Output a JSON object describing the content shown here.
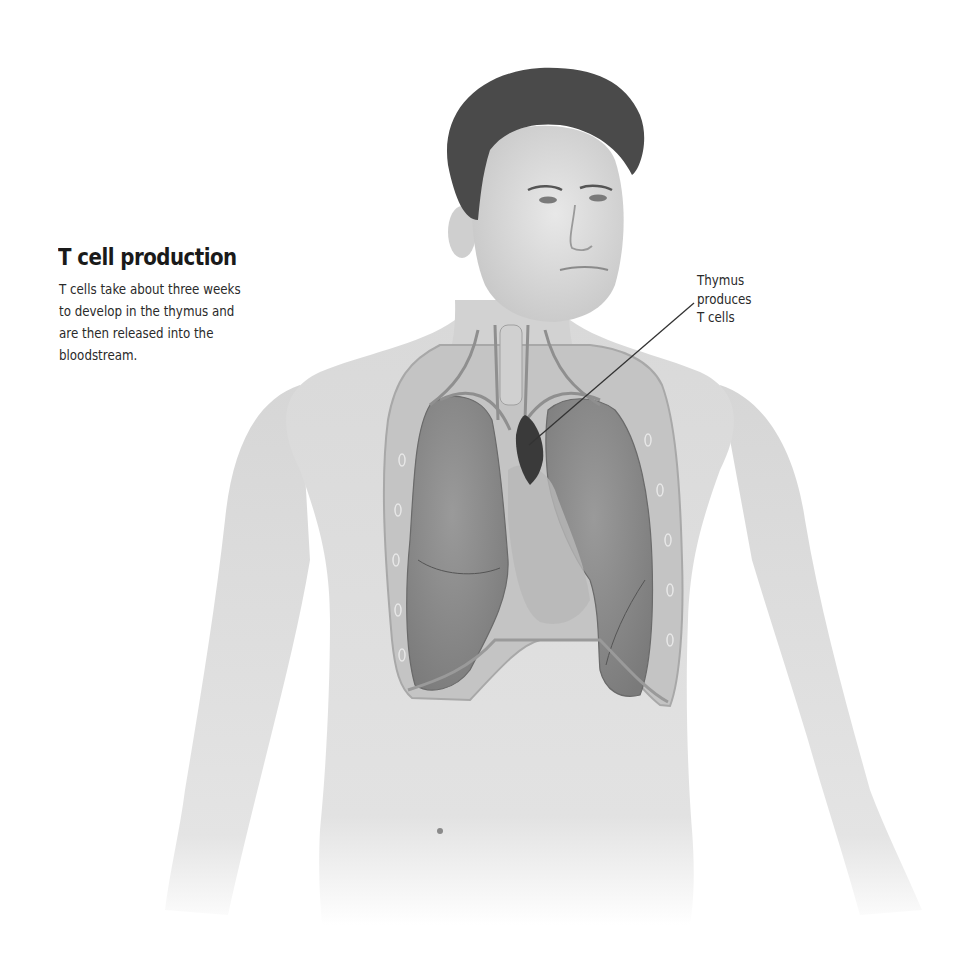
{
  "heading": {
    "title": "T cell production",
    "description_lines": [
      "T cells take about three weeks",
      "to develop in the thymus and",
      "are then released into the",
      "bloodstream."
    ]
  },
  "callouts": [
    {
      "target": "thymus",
      "lines": [
        "Thymus",
        "produces",
        "T cells"
      ]
    }
  ],
  "illustration": {
    "subject": "male-torso-anatomy",
    "visible_structures": [
      "head",
      "neck-vessels",
      "trachea",
      "thymus",
      "left-lung",
      "right-lung",
      "heart-outline",
      "diaphragm",
      "ribs",
      "navel",
      "arms"
    ],
    "colors": {
      "background": "#ffffff",
      "skin": "#dcdcdc",
      "hair": "#4a4a4a",
      "lung": "#8c8c8c",
      "thymus": "#3a3a3a",
      "leader_line": "#333333",
      "text": "#222222"
    }
  }
}
